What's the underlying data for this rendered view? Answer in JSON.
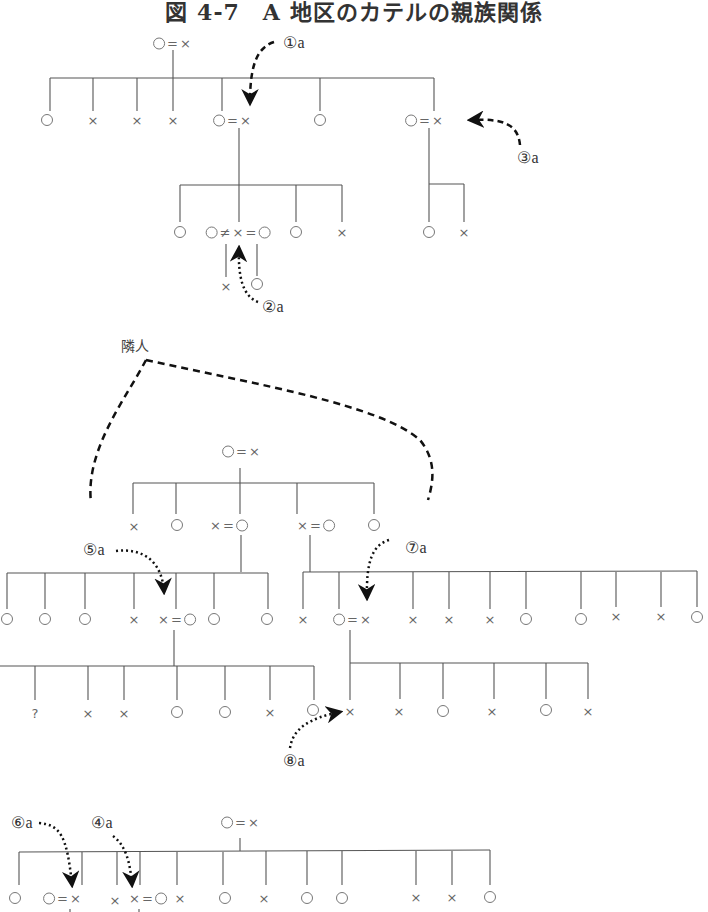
{
  "title": "図 4-7　A 地区のカテルの親族関係",
  "legend_symbols": {
    "female": "○",
    "male": "×",
    "married": "=",
    "divorced": "≠",
    "unknown": "?"
  },
  "labels": {
    "neighbor": "隣人",
    "a1": "①a",
    "a2": "②a",
    "a3": "③a",
    "a4": "④a",
    "a5": "⑤a",
    "a6": "⑥a",
    "a7": "⑦a",
    "a8": "⑧a"
  },
  "nodes": [
    {
      "id": "t1-root",
      "x": 172,
      "y": 43,
      "s": "○ = ×"
    },
    {
      "id": "t1-c1",
      "x": 47,
      "y": 120,
      "s": "○"
    },
    {
      "id": "t1-c2",
      "x": 93,
      "y": 120,
      "s": "×"
    },
    {
      "id": "t1-c3",
      "x": 137,
      "y": 120,
      "s": "×"
    },
    {
      "id": "t1-c4",
      "x": 173,
      "y": 120,
      "s": "×"
    },
    {
      "id": "t1-c5",
      "x": 232,
      "y": 120,
      "s": "○= ×"
    },
    {
      "id": "t1-c6",
      "x": 320,
      "y": 120,
      "s": "○"
    },
    {
      "id": "t1-c7",
      "x": 424,
      "y": 120,
      "s": "○= ×"
    },
    {
      "id": "t1-g1",
      "x": 180,
      "y": 232,
      "s": "○"
    },
    {
      "id": "t1-g2",
      "x": 238,
      "y": 232,
      "s": "○≠ × =○"
    },
    {
      "id": "t1-g3",
      "x": 296,
      "y": 232,
      "s": "○"
    },
    {
      "id": "t1-g4",
      "x": 342,
      "y": 232,
      "s": "×"
    },
    {
      "id": "t1-g5",
      "x": 429,
      "y": 232,
      "s": "○"
    },
    {
      "id": "t1-g6",
      "x": 464,
      "y": 232,
      "s": "×"
    },
    {
      "id": "t1-gg1",
      "x": 226,
      "y": 286,
      "s": "×"
    },
    {
      "id": "t1-gg2",
      "x": 257,
      "y": 284,
      "s": "○"
    },
    {
      "id": "t2-root",
      "x": 241,
      "y": 451,
      "s": "○= ×"
    },
    {
      "id": "t2-c1",
      "x": 134,
      "y": 526,
      "s": "×"
    },
    {
      "id": "t2-c2",
      "x": 177,
      "y": 525,
      "s": "○"
    },
    {
      "id": "t2-c3",
      "x": 229,
      "y": 525,
      "s": "× =○"
    },
    {
      "id": "t2-c4",
      "x": 316,
      "y": 525,
      "s": "× =○"
    },
    {
      "id": "t2-c5",
      "x": 374,
      "y": 525,
      "s": "○"
    },
    {
      "id": "t2-l1",
      "x": 7,
      "y": 619,
      "s": "○"
    },
    {
      "id": "t2-l2",
      "x": 45,
      "y": 619,
      "s": "○"
    },
    {
      "id": "t2-l3",
      "x": 85,
      "y": 619,
      "s": "○"
    },
    {
      "id": "t2-l4",
      "x": 134,
      "y": 619,
      "s": "×"
    },
    {
      "id": "t2-l5",
      "x": 177,
      "y": 619,
      "s": "× =○"
    },
    {
      "id": "t2-l6",
      "x": 214,
      "y": 619,
      "s": "○"
    },
    {
      "id": "t2-l7",
      "x": 267,
      "y": 619,
      "s": "○"
    },
    {
      "id": "t2-r1",
      "x": 303,
      "y": 619,
      "s": "×"
    },
    {
      "id": "t2-r2",
      "x": 352,
      "y": 619,
      "s": "○= ×"
    },
    {
      "id": "t2-r3",
      "x": 413,
      "y": 619,
      "s": "×"
    },
    {
      "id": "t2-r4",
      "x": 449,
      "y": 619,
      "s": "×"
    },
    {
      "id": "t2-r5",
      "x": 490,
      "y": 619,
      "s": "×"
    },
    {
      "id": "t2-r6",
      "x": 526,
      "y": 619,
      "s": "○"
    },
    {
      "id": "t2-r7",
      "x": 581,
      "y": 619,
      "s": "○"
    },
    {
      "id": "t2-r8",
      "x": 616,
      "y": 616,
      "s": "×"
    },
    {
      "id": "t2-r9",
      "x": 661,
      "y": 616,
      "s": "×"
    },
    {
      "id": "t2-r10",
      "x": 697,
      "y": 617,
      "s": "○"
    },
    {
      "id": "t2-ll1",
      "x": 35,
      "y": 713,
      "s": "?"
    },
    {
      "id": "t2-ll2",
      "x": 88,
      "y": 713,
      "s": "×"
    },
    {
      "id": "t2-ll3",
      "x": 124,
      "y": 713,
      "s": "×"
    },
    {
      "id": "t2-ll4",
      "x": 177,
      "y": 712,
      "s": "○"
    },
    {
      "id": "t2-ll5",
      "x": 225,
      "y": 712,
      "s": "○"
    },
    {
      "id": "t2-ll6",
      "x": 270,
      "y": 712,
      "s": "×"
    },
    {
      "id": "t2-ll7",
      "x": 313,
      "y": 710,
      "s": "○"
    },
    {
      "id": "t2-rr1",
      "x": 350,
      "y": 711,
      "s": "×"
    },
    {
      "id": "t2-rr2",
      "x": 399,
      "y": 711,
      "s": "×"
    },
    {
      "id": "t2-rr3",
      "x": 443,
      "y": 711,
      "s": "○"
    },
    {
      "id": "t2-rr4",
      "x": 492,
      "y": 711,
      "s": "×"
    },
    {
      "id": "t2-rr5",
      "x": 546,
      "y": 710,
      "s": "○"
    },
    {
      "id": "t2-rr6",
      "x": 588,
      "y": 711,
      "s": "×"
    },
    {
      "id": "t3-root",
      "x": 240,
      "y": 822,
      "s": "○= ×"
    },
    {
      "id": "t3-c1",
      "x": 15,
      "y": 898,
      "s": "○"
    },
    {
      "id": "t3-c2",
      "x": 62,
      "y": 898,
      "s": "○= ×"
    },
    {
      "id": "t3-c3",
      "x": 115,
      "y": 900,
      "s": "×"
    },
    {
      "id": "t3-c4",
      "x": 148,
      "y": 898,
      "s": "× =○"
    },
    {
      "id": "t3-c5",
      "x": 180,
      "y": 898,
      "s": "×"
    },
    {
      "id": "t3-c6",
      "x": 225,
      "y": 898,
      "s": "○"
    },
    {
      "id": "t3-c7",
      "x": 264,
      "y": 898,
      "s": "×"
    },
    {
      "id": "t3-c8",
      "x": 307,
      "y": 898,
      "s": "○"
    },
    {
      "id": "t3-c9",
      "x": 342,
      "y": 898,
      "s": "○"
    },
    {
      "id": "t3-c10",
      "x": 416,
      "y": 897,
      "s": "×"
    },
    {
      "id": "t3-c11",
      "x": 452,
      "y": 897,
      "s": "×"
    },
    {
      "id": "t3-c12",
      "x": 490,
      "y": 897,
      "s": "○"
    }
  ]
}
